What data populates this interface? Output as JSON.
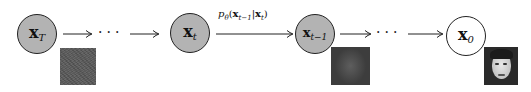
{
  "diagram": {
    "nodes": [
      {
        "id": "x_T",
        "base": "x",
        "sub": "T",
        "style": "latent"
      },
      {
        "id": "x_t",
        "base": "x",
        "sub": "t",
        "style": "latent"
      },
      {
        "id": "x_t-1",
        "base": "x",
        "sub": "t−1",
        "style": "latent"
      },
      {
        "id": "x_0",
        "base": "x",
        "sub": "0",
        "style": "observed"
      }
    ],
    "ellipsis": "···",
    "edge_label": {
      "p": "p",
      "theta": "θ",
      "open": "(",
      "x1": "x",
      "x1_sub": "t−1",
      "bar": "|",
      "x2": "x",
      "x2_sub": "t",
      "close": ")"
    },
    "images": [
      {
        "under": "x_T",
        "desc": "pure noise"
      },
      {
        "under": "x_t-1",
        "desc": "partially denoised face"
      },
      {
        "under": "x_0",
        "desc": "clean face"
      }
    ],
    "colors": {
      "latent_fill": "#b3b3b3",
      "observed_fill": "#ffffff",
      "stroke": "#222222"
    }
  }
}
